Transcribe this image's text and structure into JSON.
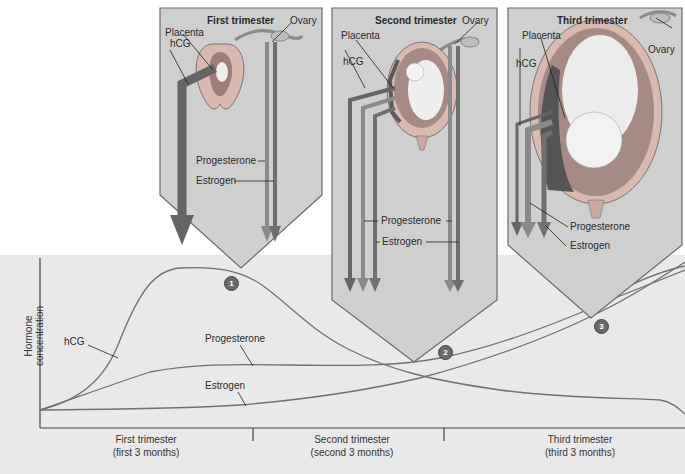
{
  "panels": [
    {
      "title": "First trimester",
      "labels": {
        "placenta": "Placenta",
        "ovary": "Ovary",
        "hcg": "hCG",
        "progesterone": "Progesterone",
        "estrogen": "Estrogen"
      }
    },
    {
      "title": "Second trimester",
      "labels": {
        "placenta": "Placenta",
        "ovary": "Ovary",
        "hcg": "hCG",
        "progesterone": "Progesterone",
        "estrogen": "Estrogen"
      }
    },
    {
      "title": "Third trimester",
      "labels": {
        "placenta": "Placenta",
        "ovary": "Ovary",
        "hcg": "hCG",
        "progesterone": "Progesterone",
        "estrogen": "Estrogen"
      }
    }
  ],
  "graph": {
    "y_axis_label_line1": "Hormone",
    "y_axis_label_line2": "concentration",
    "curve_labels": {
      "hcg": "hCG",
      "progesterone": "Progesterone",
      "estrogen": "Estrogen"
    },
    "x_sections": [
      {
        "line1": "First trimester",
        "line2": "(first 3 months)"
      },
      {
        "line1": "Second trimester",
        "line2": "(second 3 months)"
      },
      {
        "line1": "Third trimester",
        "line2": "(third 3 months)"
      }
    ],
    "markers": [
      "1",
      "2",
      "3"
    ]
  },
  "colors": {
    "panel_fill": "#cfcfcf",
    "panel_border": "#6a6a6a",
    "band": "#e9e9e9",
    "hcg_arrow": "#666666",
    "prog_arrow": "#8a8a8a",
    "estr_arrow": "#7a7a7a",
    "curve": "#6e6e6e"
  }
}
